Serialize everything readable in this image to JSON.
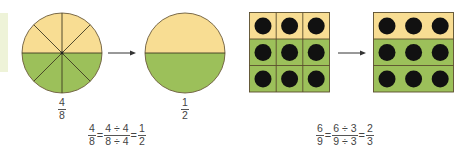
{
  "colors": {
    "yellow": "#f8dd93",
    "green": "#9cc05a",
    "outline": "#6b5a3a",
    "dot": "#111111",
    "sidebar": "#eef3d8",
    "text": "#444444"
  },
  "left_example": {
    "circle_before": {
      "parts": 8,
      "shaded_green": 4,
      "label": {
        "num": "4",
        "den": "8"
      }
    },
    "arrow": "→",
    "circle_after": {
      "parts": 2,
      "shaded_green": 1,
      "label": {
        "num": "1",
        "den": "2"
      }
    },
    "equation": {
      "lhs": {
        "num": "4",
        "den": "8"
      },
      "middle": {
        "num": "4 ÷ 4",
        "den": "8 ÷ 4"
      },
      "rhs": {
        "num": "1",
        "den": "2"
      },
      "eq": "="
    }
  },
  "right_example": {
    "grid_before": {
      "rows": 3,
      "cols": 3,
      "yellow_rows": 1,
      "green_rows": 2,
      "cell_borders": true
    },
    "arrow": "→",
    "grid_after": {
      "rows": 3,
      "cols": 3,
      "yellow_rows": 1,
      "green_rows": 2,
      "cell_borders": false
    },
    "equation": {
      "lhs": {
        "num": "6",
        "den": "9"
      },
      "middle": {
        "num": "6 ÷ 3",
        "den": "9 ÷ 3"
      },
      "rhs": {
        "num": "2",
        "den": "3"
      },
      "eq": "="
    }
  }
}
